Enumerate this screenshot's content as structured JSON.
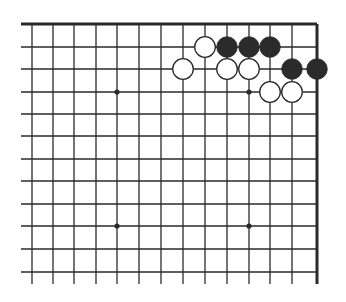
{
  "diagram": {
    "type": "go-board-corner",
    "corner": "top-right",
    "colors": {
      "line": "#2a2a2a",
      "black_stone": "#2b2b2b",
      "white_stone": "#ffffff",
      "background": "#ffffff"
    },
    "columns_x": [
      32,
      53,
      74,
      96,
      117,
      139,
      161,
      183,
      205,
      227,
      249,
      270,
      292,
      317
    ],
    "rows_y": [
      24,
      47,
      69,
      92,
      114,
      136,
      159,
      181,
      204,
      226,
      249,
      272
    ],
    "edges": {
      "top": true,
      "right": true,
      "left": false,
      "bottom": false
    },
    "star_points": [
      {
        "col": 4,
        "row": 3
      },
      {
        "col": 10,
        "row": 3
      },
      {
        "col": 4,
        "row": 9
      },
      {
        "col": 10,
        "row": 9
      }
    ],
    "stones": [
      {
        "color": "white",
        "col": 8,
        "row": 1
      },
      {
        "color": "black",
        "col": 9,
        "row": 1
      },
      {
        "color": "black",
        "col": 10,
        "row": 1
      },
      {
        "color": "black",
        "col": 11,
        "row": 1
      },
      {
        "color": "white",
        "col": 7,
        "row": 2
      },
      {
        "color": "white",
        "col": 9,
        "row": 2
      },
      {
        "color": "white",
        "col": 10,
        "row": 2
      },
      {
        "color": "black",
        "col": 12,
        "row": 2
      },
      {
        "color": "black",
        "col": 13,
        "row": 2
      },
      {
        "color": "white",
        "col": 11,
        "row": 3
      },
      {
        "color": "white",
        "col": 12,
        "row": 3
      }
    ]
  }
}
